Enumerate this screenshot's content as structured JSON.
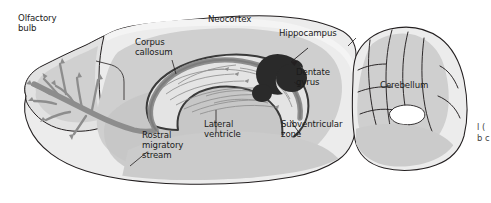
{
  "figure": {
    "type": "anatomical-diagram",
    "background_color": "#ffffff",
    "palette": {
      "outline": "#231f20",
      "tissue_light": "#e8e8e8",
      "tissue_mid": "#d2d2d2",
      "tissue_dark": "#bdbdbd",
      "stream_gray": "#8d8d8d",
      "hippocampus_dark": "#2a2a2a",
      "ventricle_outline": "#3a3a3a",
      "label_text": "#1a1a1a"
    }
  },
  "labels": {
    "olfactory_bulb": "Olfactory\nbulb",
    "neocortex": "Neocortex",
    "corpus_callosum": "Corpus\ncallosum",
    "hippocampus": "Hippocampus",
    "dentate_gyrus": "Dentate\ngyrus",
    "cerebellum": "Cerebellum",
    "rostral_migratory_stream": "Rostral\nmigratory\nstream",
    "lateral_ventricle": "Lateral\nventricle",
    "subventricular_zone": "Subventricular\nzone"
  },
  "caption_fragment": "l\n(\nb\nc"
}
